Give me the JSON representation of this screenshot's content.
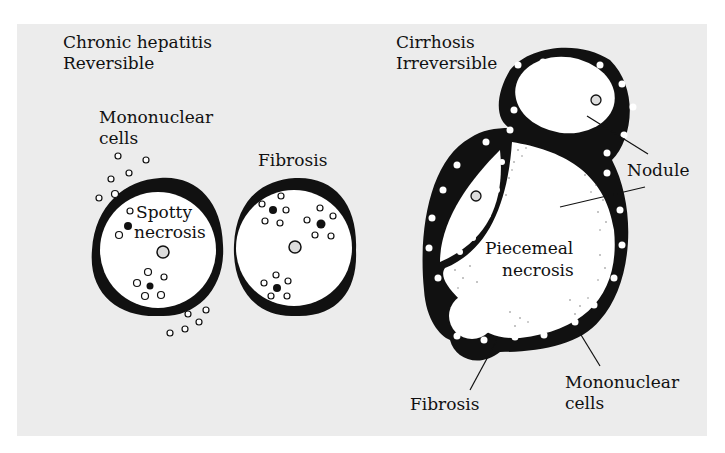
{
  "diagram": {
    "left_panel": {
      "title_line1": "Chronic hepatitis",
      "title_line2": "Reversible",
      "label_mononuclear_line1": "Mononuclear",
      "label_mononuclear_line2": "cells",
      "label_spotty_line1": "Spotty",
      "label_spotty_line2": "necrosis",
      "label_fibrosis": "Fibrosis"
    },
    "right_panel": {
      "title_line1": "Cirrhosis",
      "title_line2": "Irreversible",
      "label_nodule": "Nodule",
      "label_piecemeal_line1": "Piecemeal",
      "label_piecemeal_line2": "necrosis",
      "label_fibrosis": "Fibrosis",
      "label_mononuclear_line1": "Mononuclear",
      "label_mononuclear_line2": "cells"
    },
    "colors": {
      "background": "#ececec",
      "ink": "#111111",
      "cell_fill": "#ffffff"
    }
  }
}
